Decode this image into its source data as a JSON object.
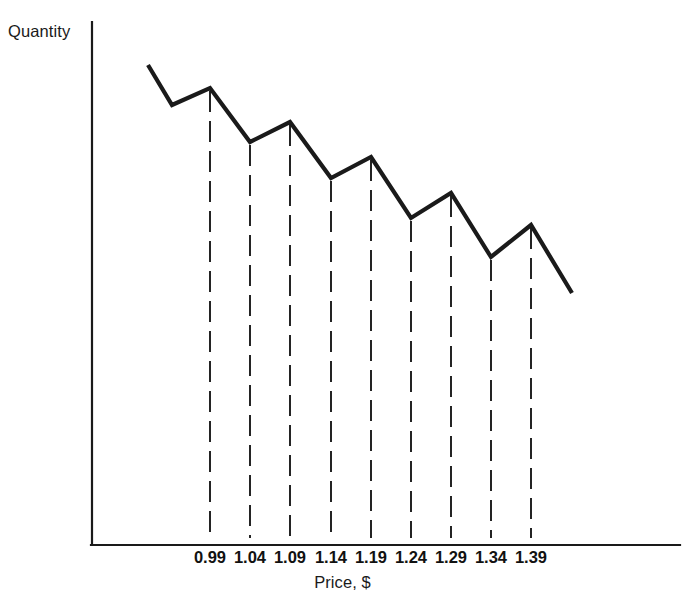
{
  "figure": {
    "background_color": "#ffffff",
    "line_color": "#1a1a1a",
    "axis_color": "#1a1a1a"
  },
  "labels": {
    "y_axis": "Quantity",
    "x_axis": "Price, $"
  },
  "chart_data": {
    "type": "line",
    "title": "",
    "subtitle": "",
    "xlabel": "Price, $",
    "ylabel": "Quantity",
    "grid": false,
    "legend": "none",
    "annotation": "Sawtooth demand curve: quantity demanded jumps at psychological price points (prices ending in .99, .09, .19, .29, .39) and declines between them.",
    "x_tick_labels": [
      "0.99",
      "1.04",
      "1.09",
      "1.14",
      "1.19",
      "1.24",
      "1.29",
      "1.34",
      "1.39"
    ],
    "y_tick_labels": [],
    "price_points": [
      {
        "price": "0.99",
        "kind": "peak",
        "x_px": 210,
        "y_px": 88
      },
      {
        "price": "1.04",
        "kind": "valley",
        "x_px": 250,
        "y_px": 142
      },
      {
        "price": "1.09",
        "kind": "peak",
        "x_px": 290,
        "y_px": 122
      },
      {
        "price": "1.14",
        "kind": "valley",
        "x_px": 331,
        "y_px": 178
      },
      {
        "price": "1.19",
        "kind": "peak",
        "x_px": 371,
        "y_px": 157
      },
      {
        "price": "1.24",
        "kind": "valley",
        "x_px": 411,
        "y_px": 218
      },
      {
        "price": "1.29",
        "kind": "peak",
        "x_px": 451,
        "y_px": 193
      },
      {
        "price": "1.34",
        "kind": "valley",
        "x_px": 491,
        "y_px": 257
      },
      {
        "price": "1.39",
        "kind": "peak",
        "x_px": 531,
        "y_px": 225
      }
    ],
    "curve_points_px": [
      {
        "x": 148,
        "y": 65
      },
      {
        "x": 172,
        "y": 105
      },
      {
        "x": 210,
        "y": 88
      },
      {
        "x": 250,
        "y": 142
      },
      {
        "x": 290,
        "y": 122
      },
      {
        "x": 331,
        "y": 178
      },
      {
        "x": 371,
        "y": 157
      },
      {
        "x": 411,
        "y": 218
      },
      {
        "x": 451,
        "y": 193
      },
      {
        "x": 491,
        "y": 257
      },
      {
        "x": 531,
        "y": 225
      },
      {
        "x": 572,
        "y": 293
      }
    ],
    "axes_px": {
      "y_axis_x": 92,
      "y_axis_top": 22,
      "x_axis_y": 545,
      "x_axis_right": 680
    },
    "dashed_drop_line_bottom_px": 538
  }
}
